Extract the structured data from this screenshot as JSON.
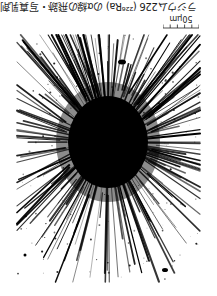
{
  "caption": {
    "text": "ラジウム226 (²²⁶Ra) のα線の飛跡・写真乳剤",
    "orientation_deg": 180
  },
  "scale_bar": {
    "label": "50μm",
    "ticks": 6,
    "orientation_deg": 180
  },
  "micrograph": {
    "subject": "alpha-particle track star (radial burst)",
    "colors": {
      "foreground": "#000000",
      "background": "#ffffff"
    },
    "center": {
      "x": 108,
      "y": 112
    },
    "core_radius": {
      "rx": 40,
      "ry": 46
    },
    "ray_count": 220,
    "ray_length_range": [
      60,
      140
    ],
    "bounds": {
      "left": 17,
      "right": 200,
      "top": 5,
      "bottom": 252
    }
  }
}
